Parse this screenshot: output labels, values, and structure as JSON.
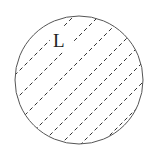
{
  "diagram": {
    "label": "L",
    "shape": "circle",
    "fill": "diagonal-dashed-hatch",
    "stroke_color": "#555555",
    "hatch_color": "#333333"
  }
}
